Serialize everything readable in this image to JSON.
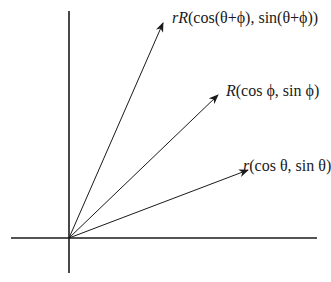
{
  "diagram": {
    "axes": {
      "origin": [
        69,
        238
      ],
      "x_axis": {
        "from": [
          11,
          238
        ],
        "to": [
          317,
          238
        ]
      },
      "y_axis": {
        "from": [
          69,
          11
        ],
        "to": [
          69,
          273
        ]
      }
    },
    "vectors": [
      {
        "id": "rR",
        "tip": [
          163,
          23
        ],
        "label_prefix": "rR",
        "label_rest": "(cos(θ+ϕ), sin(θ+ϕ))",
        "label_pos": [
          172,
          10
        ]
      },
      {
        "id": "R",
        "tip": [
          218,
          95
        ],
        "label_prefix": "R",
        "label_rest": "(cos ϕ, sin ϕ)",
        "label_pos": [
          226,
          83
        ]
      },
      {
        "id": "r",
        "tip": [
          248,
          170
        ],
        "label_prefix": "r",
        "label_rest": "(cos θ, sin θ)",
        "label_pos": [
          243,
          158
        ]
      }
    ],
    "colors": {
      "line": "#1a1a1a",
      "background": "#ffffff"
    }
  }
}
